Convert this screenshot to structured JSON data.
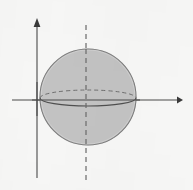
{
  "figure": {
    "name": "sphere-with-equator-and-axes",
    "caption": "",
    "width": 193,
    "height": 190,
    "background_color": "#f6f6f5"
  },
  "colors": {
    "background": "#f6f6f5",
    "sphere_fill": "#c2c2c2",
    "sphere_stroke": "#5d5d5d",
    "axis_stroke": "#4a4a4a",
    "arrow_fill": "#3a3a3a",
    "equator_front_stroke": "#4f4f4f",
    "equator_back_stroke": "#6f6f6f",
    "dashed_axis_stroke": "#6a6a6a"
  },
  "chart_data": {
    "type": "diagram",
    "title": "",
    "subtitle": "",
    "xlabel": "",
    "ylabel": "",
    "grid": false,
    "legend": [],
    "annotations": [],
    "elements": [
      {
        "id": "y-axis",
        "kind": "axis",
        "orientation": "vertical",
        "label": "",
        "x": 37,
        "y_start": 178,
        "y_end": 24,
        "arrow": "up",
        "style": "solid"
      },
      {
        "id": "x-axis",
        "kind": "axis",
        "orientation": "horizontal",
        "label": "",
        "y": 100,
        "x_start": 12,
        "x_end": 177,
        "arrow": "right",
        "style": "solid"
      },
      {
        "id": "sphere",
        "kind": "circle",
        "label": "",
        "cx": 88,
        "cy": 97,
        "r": 48,
        "fill": "#c2c2c2",
        "style": "solid"
      },
      {
        "id": "equator-back",
        "kind": "ellipse-arc",
        "label": "",
        "cx": 88,
        "cy": 98,
        "rx": 48,
        "ry": 8,
        "half": "upper",
        "style": "dashed",
        "dash_pattern": "4 3"
      },
      {
        "id": "equator-front",
        "kind": "ellipse-arc",
        "label": "",
        "cx": 88,
        "cy": 98,
        "rx": 48,
        "ry": 8,
        "half": "lower",
        "style": "solid"
      },
      {
        "id": "polar-axis",
        "kind": "line",
        "label": "",
        "x": 86,
        "y_start": 25,
        "y_end": 180,
        "style": "dashed",
        "dash_pattern": "5 4"
      }
    ]
  }
}
